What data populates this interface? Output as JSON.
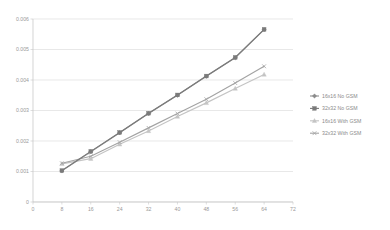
{
  "chart_data": {
    "type": "line",
    "title": "",
    "xlabel": "",
    "ylabel": "",
    "xlim": [
      0,
      72
    ],
    "ylim": [
      0,
      0.006
    ],
    "grid": "horizontal",
    "legend_position": "right",
    "x": [
      8,
      16,
      24,
      32,
      40,
      48,
      56,
      64
    ],
    "xticks": [
      "0",
      "8",
      "16",
      "24",
      "32",
      "40",
      "48",
      "56",
      "64",
      "72"
    ],
    "xtick_values": [
      0,
      8,
      16,
      24,
      32,
      40,
      48,
      56,
      64,
      72
    ],
    "yticks": [
      "0",
      "0.001",
      "0.002",
      "0.003",
      "0.004",
      "0.005",
      "0.006"
    ],
    "ytick_values": [
      0,
      0.001,
      0.002,
      0.003,
      0.004,
      0.005,
      0.006
    ],
    "series": [
      {
        "name": "16x16 No GSM",
        "color": "#8c8c8c",
        "marker": "diamond",
        "values": [
          0.00102,
          0.00165,
          0.00227,
          0.0029,
          0.0035,
          0.00412,
          0.00473,
          0.00565
        ]
      },
      {
        "name": "32x32 No GSM",
        "color": "#7a7a7a",
        "marker": "square",
        "values": [
          0.00103,
          0.00166,
          0.00228,
          0.00291,
          0.00351,
          0.00413,
          0.00474,
          0.00566
        ]
      },
      {
        "name": "16x16 With GSM",
        "color": "#c4c4c4",
        "marker": "triangle",
        "values": [
          0.00125,
          0.00142,
          0.00189,
          0.00233,
          0.0028,
          0.00325,
          0.00372,
          0.00418
        ]
      },
      {
        "name": "32x32 With GSM",
        "color": "#a3a3a3",
        "marker": "cross",
        "values": [
          0.00127,
          0.0015,
          0.00196,
          0.00243,
          0.0029,
          0.00337,
          0.0039,
          0.00445
        ]
      }
    ]
  }
}
